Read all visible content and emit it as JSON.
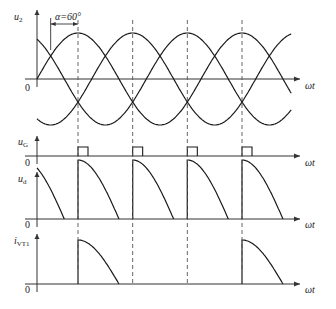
{
  "alpha_annotation": "α=60°",
  "alpha_deg": 60,
  "x_axis_label": "ωt",
  "zero_label": "0",
  "panels": [
    {
      "id": "u2",
      "label": "u",
      "sub": "2",
      "description": "three-phase supply voltages"
    },
    {
      "id": "uG",
      "label": "u",
      "sub": "G",
      "description": "gate pulses"
    },
    {
      "id": "ud",
      "label": "u",
      "sub": "d",
      "description": "output voltage"
    },
    {
      "id": "iVT1",
      "label": "i",
      "sub": "VT1",
      "description": "thyristor VT1 current"
    }
  ],
  "colors": {
    "line": "#1a1a1a",
    "axis": "#333333",
    "dash": "#555555"
  }
}
